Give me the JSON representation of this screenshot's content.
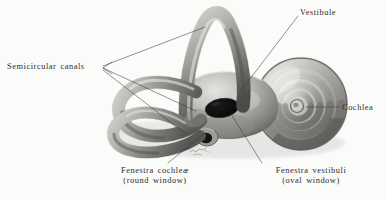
{
  "plate": {
    "subject": "bony labyrinth of the inner ear",
    "view": "lateral view, right side",
    "medium": "halftone engraving on off-white paper",
    "width": 387,
    "height": 200
  },
  "labels": {
    "semicircular_canals": "Semicircular canals",
    "vestibule": "Vestibule",
    "cochlea": "Cochlea",
    "fenestra_cochleae_line1": "Fenestra cochleæ",
    "fenestra_cochleae_line2": "(round window)",
    "fenestra_vestibuli_line1": "Fenestra vestibuli",
    "fenestra_vestibuli_line2": "(oval window)"
  },
  "colors": {
    "paper": "#fbfbfa",
    "ink": "#2b2b2b",
    "leader": "#3a3a3a",
    "shadow_deep": "#3f3f3f",
    "shadow": "#6e6e6e",
    "midtone": "#9a9a9a",
    "light": "#c9c9c9",
    "highlight": "#f2f2f0",
    "window_dark": "#0d0d0d"
  },
  "structures": {
    "superior_canal": "superior semicircular canal",
    "lateral_canal": "lateral semicircular canal",
    "posterior_canal": "posterior semicircular canal",
    "vestibule_body": "vestibule",
    "cochlea_spiral": "cochlear spiral",
    "oval_window": "fenestra vestibuli (oval window)",
    "round_window": "fenestra cochleæ (round window)",
    "artist_signature": "artist signature mark"
  }
}
